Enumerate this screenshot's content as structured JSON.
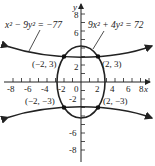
{
  "figure": {
    "axes": {
      "x_label": "x",
      "y_label": "y",
      "x_ticks": [
        "-8",
        "-6",
        "-4",
        "-2",
        "0",
        "2",
        "4",
        "6",
        "8"
      ],
      "y_ticks_pos": [
        "2",
        "6",
        "8"
      ],
      "y_ticks_neg": [
        "-2",
        "-6",
        "-8"
      ],
      "range": [
        -9,
        9
      ]
    },
    "equations": {
      "hyperbola": "x² − 9y² = −77",
      "ellipse": "9x² + 4y² = 72"
    },
    "points": [
      {
        "label": "(−2, 3)"
      },
      {
        "label": "(2, 3)"
      },
      {
        "label": "(−2, −3)"
      },
      {
        "label": "(2, −3)"
      }
    ],
    "colors": {
      "ink": "#222222",
      "background": "#ffffff"
    }
  }
}
